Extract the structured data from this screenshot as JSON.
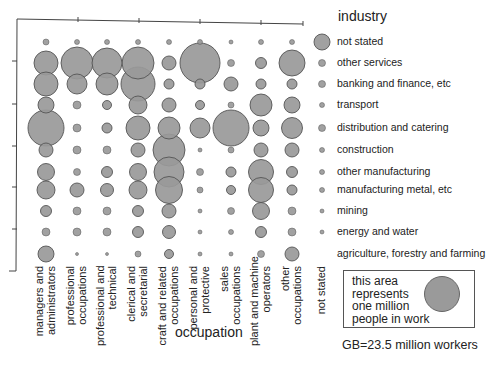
{
  "chart_data": {
    "type": "bubble-matrix",
    "title": "",
    "xlabel": "occupation",
    "ylabel": "industry",
    "note": "GB=23.5 million workers",
    "scale_legend": "this area represents one million people in work",
    "occupations": [
      "managers and administrators",
      "professional occupations",
      "professional and technical",
      "clerical and secretarial",
      "craft and related occupations",
      "personal and protective",
      "sales occupations",
      "plant and machine operators",
      "other occupations",
      "not stated"
    ],
    "industries": [
      "not stated",
      "other services",
      "banking and finance, etc",
      "transport",
      "distribution and catering",
      "construction",
      "other manufacturing",
      "manufacturing metal, etc",
      "mining",
      "energy and water",
      "agriculture, forestry and farming"
    ],
    "bubble_radius_px": [
      [
        3,
        2.5,
        2.5,
        2.5,
        2.5,
        2.5,
        2,
        2.5,
        2.5,
        8
      ],
      [
        12,
        16,
        15,
        16,
        7,
        20,
        3.5,
        5.5,
        13,
        3.5
      ],
      [
        12,
        10,
        11,
        17,
        5,
        5,
        7,
        5,
        5,
        3.5
      ],
      [
        8,
        4,
        4.5,
        9,
        7,
        4.5,
        3,
        11,
        8,
        2.5
      ],
      [
        18,
        4,
        5,
        12,
        11,
        10,
        18,
        8,
        10.5,
        3.5
      ],
      [
        7,
        4,
        4,
        7,
        16,
        2,
        3,
        7,
        7,
        2.5
      ],
      [
        8.5,
        3.5,
        5.5,
        8.5,
        15,
        3.5,
        5,
        12.5,
        5.5,
        2.5
      ],
      [
        9,
        7,
        6.5,
        9,
        13.5,
        3,
        4.5,
        12.5,
        5,
        2.5
      ],
      [
        5.5,
        4,
        4,
        5.5,
        7,
        2,
        3.5,
        8.5,
        4,
        2
      ],
      [
        4,
        4,
        4,
        5.5,
        6.5,
        2,
        2.5,
        5.5,
        4,
        2
      ],
      [
        8,
        1.5,
        1.5,
        3,
        4.5,
        2,
        2,
        3.5,
        7,
        0
      ]
    ],
    "x_ticks_count": 4,
    "y_ticks_count": 4,
    "grid": false,
    "legend_position": "right"
  },
  "colors": {
    "bubble_fill": "#999999",
    "bubble_stroke": "#555555",
    "axis": "#444444"
  }
}
